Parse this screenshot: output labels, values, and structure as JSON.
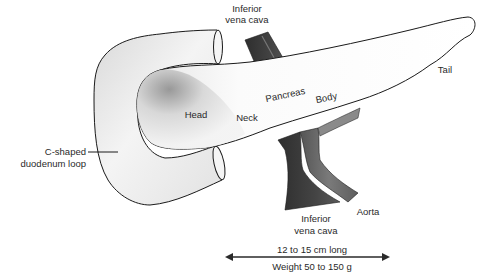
{
  "diagram": {
    "labels": {
      "ivc_top_line1": "Inferior",
      "ivc_top_line2": "vena cava",
      "head": "Head",
      "neck": "Neck",
      "pancreas": "Pancreas",
      "body": "Body",
      "tail": "Tail",
      "duodenum_line1": "C-shaped",
      "duodenum_line2": "duodenum loop",
      "ivc_bottom_line1": "Inferior",
      "ivc_bottom_line2": "vena cava",
      "aorta": "Aorta"
    },
    "dimensions": {
      "length": "12 to 15 cm long",
      "weight": "Weight 50 to 150 g"
    },
    "colors": {
      "outline": "#1a1a1a",
      "organ_fill": "#f2f2f2",
      "organ_shade": "#9a9a9a",
      "ivc": "#3a3a3a",
      "aorta": "#6b6b6b",
      "text": "#2a2a2a"
    }
  }
}
